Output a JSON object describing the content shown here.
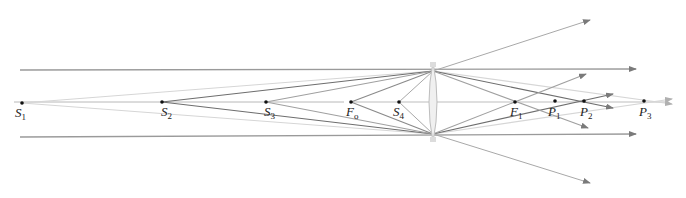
{
  "diagram": {
    "colors": {
      "axis": "#b8b8b8",
      "ray_dark": "#6e6e6e",
      "ray_mid": "#8c8c8c",
      "ray_light": "#cfcfcf",
      "point": "#111111",
      "lens_fill": "#efefef",
      "lens_stroke": "#bdbdbd"
    },
    "axis_y": 102,
    "lens": {
      "x": 433,
      "top": 62,
      "bottom": 142,
      "label": "lens"
    },
    "points": [
      {
        "id": "S1",
        "main": "S",
        "sub": "1",
        "x": 22,
        "y": 103
      },
      {
        "id": "S2",
        "main": "S",
        "sub": "2",
        "x": 162,
        "y": 102
      },
      {
        "id": "S3",
        "main": "S",
        "sub": "3",
        "x": 266,
        "y": 102
      },
      {
        "id": "Fo",
        "main": "F",
        "sub": "o",
        "x": 351,
        "y": 102
      },
      {
        "id": "S4",
        "main": "S",
        "sub": "4",
        "x": 399,
        "y": 102
      },
      {
        "id": "F1",
        "main": "F",
        "sub": "1",
        "x": 515,
        "y": 102
      },
      {
        "id": "P1",
        "main": "P",
        "sub": "1",
        "x": 555,
        "y": 102
      },
      {
        "id": "P2",
        "main": "P",
        "sub": "2",
        "x": 584,
        "y": 101
      },
      {
        "id": "P3",
        "main": "P",
        "sub": "3",
        "x": 644,
        "y": 101
      }
    ],
    "labels": {
      "S1": "S",
      "S1_sub": "1",
      "S2": "S",
      "S2_sub": "2",
      "S3": "S",
      "S3_sub": "3",
      "Fo": "F",
      "Fo_sub": "o",
      "S4": "S",
      "S4_sub": "4",
      "F1": "F",
      "F1_sub": "1",
      "P1": "P",
      "P1_sub": "1",
      "P2": "P",
      "P2_sub": "2",
      "P3": "P",
      "P3_sub": "3"
    }
  }
}
